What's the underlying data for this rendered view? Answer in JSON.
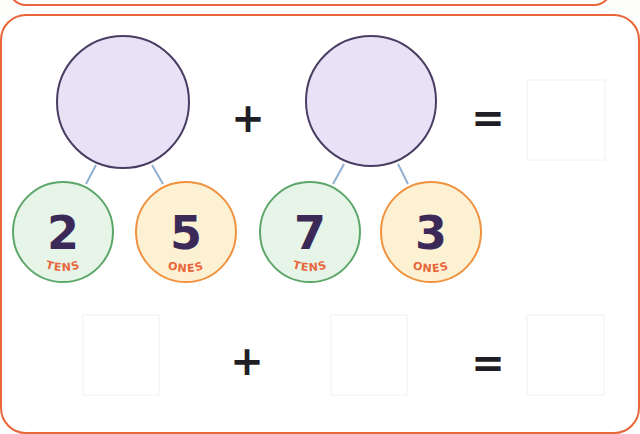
{
  "colors": {
    "panel_border": "#e8663a",
    "big_circle_fill": "#e7e2f5",
    "big_circle_stroke": "#4a3d63",
    "tens_fill": "#e6f5e8",
    "tens_stroke": "#5da66a",
    "ones_fill": "#fdf1d4",
    "ones_stroke": "#f0913e",
    "digit_color": "#3b2a57",
    "label_color": "#e8663a",
    "connector_color": "#8fb0d0"
  },
  "row1": {
    "group1": {
      "whole": "",
      "tens": {
        "value": "2",
        "label": "TENS"
      },
      "ones": {
        "value": "5",
        "label": "ONES"
      }
    },
    "operator": "+",
    "group2": {
      "whole": "",
      "tens": {
        "value": "7",
        "label": "TENS"
      },
      "ones": {
        "value": "3",
        "label": "ONES"
      }
    },
    "equals": "=",
    "answer": ""
  },
  "row2": {
    "box1": "",
    "operator": "+",
    "box2": "",
    "equals": "=",
    "answer": ""
  }
}
